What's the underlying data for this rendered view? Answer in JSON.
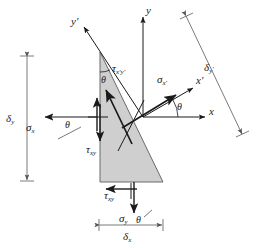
{
  "figure": {
    "colors": {
      "wedge_fill": "#cfcfcf",
      "wedge_stroke": "#555555",
      "axis": "#1a1a1a",
      "dimension": "#6b6b6b",
      "background": "#ffffff"
    },
    "axes": [
      {
        "name": "y-axis",
        "label": "y",
        "prime": false
      },
      {
        "name": "x-axis",
        "label": "x",
        "prime": false
      },
      {
        "name": "y-prime-axis",
        "label": "y",
        "prime": true
      },
      {
        "name": "x-prime-axis",
        "label": "x",
        "prime": true
      }
    ],
    "stresses": [
      {
        "name": "sigma-x",
        "symbol": "σ",
        "sub": "x",
        "prime": false,
        "kind": "normal"
      },
      {
        "name": "sigma-y",
        "symbol": "σ",
        "sub": "y",
        "prime": false,
        "kind": "normal"
      },
      {
        "name": "sigma-x-prime",
        "symbol": "σ",
        "sub": "x",
        "prime": true,
        "kind": "normal"
      },
      {
        "name": "tau-xy-left",
        "symbol": "τ",
        "sub": "xy",
        "prime": false,
        "kind": "shear"
      },
      {
        "name": "tau-xy-bottom",
        "symbol": "τ",
        "sub": "xy",
        "prime": false,
        "kind": "shear"
      },
      {
        "name": "tau-xpyp",
        "symbol": "τ",
        "sub": "x'y'",
        "prime": true,
        "kind": "shear"
      }
    ],
    "angles": [
      {
        "name": "theta-apex",
        "label": "θ"
      },
      {
        "name": "theta-axis",
        "label": "θ"
      },
      {
        "name": "theta-left",
        "label": "θ"
      },
      {
        "name": "theta-bottom",
        "label": "θ"
      }
    ],
    "dimensions": [
      {
        "name": "delta-y",
        "symbol": "δ",
        "sub": "y",
        "prime": false,
        "orientation": "vertical"
      },
      {
        "name": "delta-x",
        "symbol": "δ",
        "sub": "x",
        "prime": false,
        "orientation": "horizontal"
      },
      {
        "name": "delta-y-prime",
        "symbol": "δ",
        "sub": "y",
        "prime": true,
        "orientation": "inclined"
      }
    ],
    "text": {
      "y": "y",
      "x": "x",
      "y_prime": "y′",
      "x_prime": "x′",
      "sigma": "σ",
      "tau": "τ",
      "delta": "δ",
      "theta": "θ",
      "sub_x": "x",
      "sub_y": "y",
      "sub_xy": "xy",
      "sub_x_prime": "x′",
      "sub_xpyp": "x′y′",
      "prime": "′"
    }
  }
}
